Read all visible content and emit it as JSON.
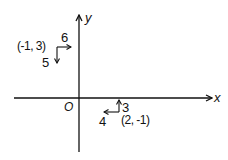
{
  "diagram": {
    "axes": {
      "x_label": "x",
      "y_label": "y",
      "origin_label": "O"
    },
    "vectors": [
      {
        "point_label": "(-1, 3)",
        "horizontal_component": {
          "label": "6",
          "direction": "right"
        },
        "vertical_component": {
          "label": "5",
          "direction": "down"
        }
      },
      {
        "point_label": "(2, -1)",
        "horizontal_component": {
          "label": "4",
          "direction": "left"
        },
        "vertical_component": {
          "label": "3",
          "direction": "up"
        }
      }
    ],
    "colors": {
      "ink": "#111111",
      "background": "#ffffff"
    }
  }
}
